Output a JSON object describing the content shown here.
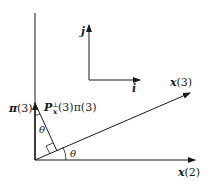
{
  "diagram": {
    "type": "vector-projection",
    "axes": {
      "horizontal_label_var": "x",
      "horizontal_label_arg": "(2)",
      "oblique_label_var": "x",
      "oblique_label_arg": "(3)"
    },
    "basis": {
      "i_label": "i",
      "j_label": "j"
    },
    "vectors": {
      "pi_var": "π",
      "pi_arg": "(3)",
      "projection_P": "P",
      "projection_sub": "x",
      "projection_sup": "⊥",
      "projection_rest": "(3)π(3)"
    },
    "angles": {
      "theta_top": "θ",
      "theta_bottom": "θ"
    }
  }
}
